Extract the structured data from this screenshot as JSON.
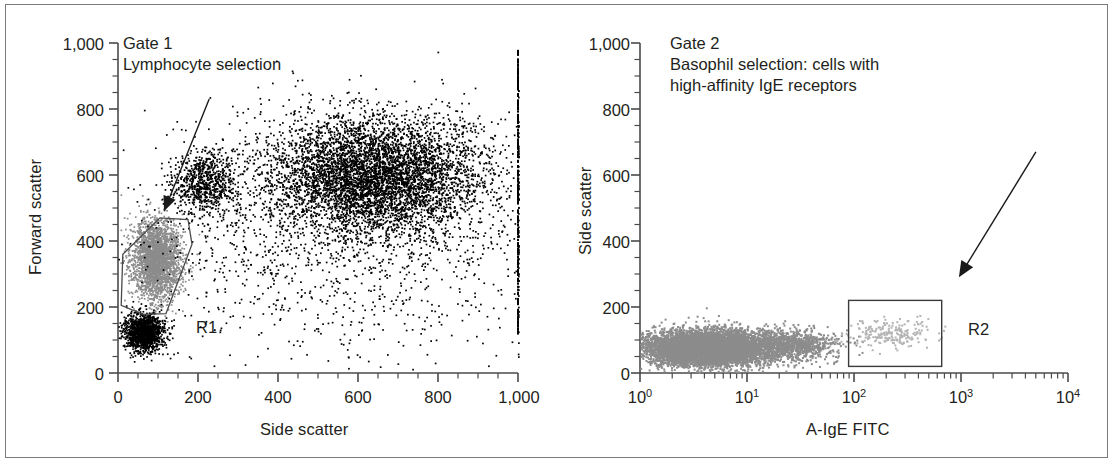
{
  "figure": {
    "type": "flow-cytometry-dot-plots",
    "panel_count": 2,
    "border_color": "#7a7a7a",
    "background": "#ffffff"
  },
  "panels": [
    {
      "id": "gate1",
      "caption_lines": [
        "Gate 1",
        "Lymphocyte selection"
      ],
      "xlabel": "Side scatter",
      "ylabel": "Forward scatter",
      "x_ticks": [
        "0",
        "200",
        "400",
        "600",
        "800",
        "1,000"
      ],
      "y_ticks": [
        "0",
        "200",
        "400",
        "600",
        "800",
        "1,000"
      ],
      "x_minor_interval": 50,
      "y_minor_interval": 50,
      "xlim": [
        0,
        1000
      ],
      "ylim": [
        0,
        1000
      ],
      "xscale": "linear",
      "yscale": "linear",
      "region": {
        "label": "R1",
        "shape": "polygon",
        "fill": "none",
        "stroke": "#4a4a4a"
      },
      "annotation_arrow": {
        "name": "gate1-arrow",
        "description": "arrow pointing into the R1 lymphocyte gate"
      },
      "populations": [
        {
          "name": "lymphocytes-gated",
          "color": "#8c8c8c",
          "note": "grey events inside R1"
        },
        {
          "name": "debris-and-granulocytes",
          "color": "#000000",
          "note": "black events outside R1"
        }
      ]
    },
    {
      "id": "gate2",
      "caption_lines": [
        "Gate 2",
        "Basophil selection: cells with",
        "high-affinity IgE receptors"
      ],
      "xlabel": "A-IgE FITC",
      "ylabel": "Side scatter",
      "x_ticks": [
        "10⁰",
        "10¹",
        "10²",
        "10³",
        "10⁴"
      ],
      "x_tick_bases": [
        "10",
        "10",
        "10",
        "10",
        "10"
      ],
      "x_tick_exponents": [
        "0",
        "1",
        "2",
        "3",
        "4"
      ],
      "y_ticks": [
        "0",
        "200",
        "400",
        "600",
        "800",
        "1,000"
      ],
      "y_minor_interval": 50,
      "xlim": [
        1,
        10000
      ],
      "ylim": [
        0,
        1000
      ],
      "xscale": "log",
      "yscale": "linear",
      "region": {
        "label": "R2",
        "shape": "rectangle",
        "fill": "none",
        "stroke": "#3b3b3b"
      },
      "annotation_arrow": {
        "name": "gate2-arrow",
        "description": "arrow pointing into the R2 basophil gate"
      },
      "populations": [
        {
          "name": "non-basophil-leukocytes",
          "color": "#8c8c8c",
          "note": "grey events low A-IgE FITC"
        },
        {
          "name": "basophils",
          "color": "#8c8c8c",
          "note": "faint grey events inside R2"
        }
      ]
    }
  ],
  "chart_data": [
    {
      "type": "scatter",
      "id": "gate1",
      "title": "Gate 1",
      "subtitle": "Lymphocyte selection",
      "xlabel": "Side scatter",
      "ylabel": "Forward scatter",
      "xlim": [
        0,
        1000
      ],
      "ylim": [
        0,
        1000
      ],
      "xscale": "linear",
      "yscale": "linear",
      "xticks": [
        0,
        200,
        400,
        600,
        800,
        1000
      ],
      "yticks": [
        0,
        200,
        400,
        600,
        800,
        1000
      ],
      "xticklabels": [
        "0",
        "200",
        "400",
        "600",
        "800",
        "1,000"
      ],
      "yticklabels": [
        "0",
        "200",
        "400",
        "600",
        "800",
        "1,000"
      ],
      "grid": false,
      "legend": "none",
      "series": [
        {
          "name": "lymphocytes (R1 gated)",
          "color": "#8c8c8c",
          "n": 2600,
          "cluster": {
            "x_center": 95,
            "y_center": 345,
            "x_sd": 30,
            "y_sd": 62
          }
        },
        {
          "name": "debris / platelets",
          "color": "#000000",
          "n": 1400,
          "cluster": {
            "x_center": 62,
            "y_center": 125,
            "x_sd": 25,
            "y_sd": 28
          }
        },
        {
          "name": "monocytes",
          "color": "#000000",
          "n": 750,
          "cluster": {
            "x_center": 215,
            "y_center": 580,
            "x_sd": 42,
            "y_sd": 48
          }
        },
        {
          "name": "granulocytes",
          "color": "#000000",
          "n": 5200,
          "cluster": {
            "x_center": 640,
            "y_center": 600,
            "x_sd": 135,
            "y_sd": 90
          }
        },
        {
          "name": "scattered events",
          "color": "#000000",
          "n": 1500,
          "cluster": {
            "x_center": 560,
            "y_center": 420,
            "x_sd": 250,
            "y_sd": 190
          }
        }
      ],
      "annotations": [
        {
          "text": "R1",
          "x": 300,
          "y": 150,
          "kind": "region-label"
        },
        {
          "kind": "arrow",
          "from": [
            228,
            830
          ],
          "to": [
            115,
            490
          ]
        }
      ],
      "regions": [
        {
          "label": "R1",
          "type": "polygon",
          "points": [
            [
              8,
              205
            ],
            [
              12,
              360
            ],
            [
              105,
              470
            ],
            [
              175,
              465
            ],
            [
              185,
              390
            ],
            [
              120,
              180
            ],
            [
              62,
              178
            ]
          ]
        }
      ]
    },
    {
      "type": "scatter",
      "id": "gate2",
      "title": "Gate 2",
      "subtitle": "Basophil selection: cells with high-affinity IgE receptors",
      "xlabel": "A-IgE FITC",
      "ylabel": "Side scatter",
      "xlim": [
        1,
        10000
      ],
      "ylim": [
        0,
        1000
      ],
      "xscale": "log",
      "yscale": "linear",
      "xticks": [
        1,
        10,
        100,
        1000,
        10000
      ],
      "yticks": [
        0,
        200,
        400,
        600,
        800,
        1000
      ],
      "xticklabels": [
        "10^0",
        "10^1",
        "10^2",
        "10^3",
        "10^4"
      ],
      "yticklabels": [
        "0",
        "200",
        "400",
        "600",
        "800",
        "1,000"
      ],
      "grid": false,
      "legend": "none",
      "series": [
        {
          "name": "IgE-negative leukocytes",
          "color": "#8c8c8c",
          "n": 7000,
          "cluster": {
            "x_center_log": 0.62,
            "y_center": 78,
            "x_sd_log": 0.3,
            "y_sd": 26
          }
        },
        {
          "name": "intermediate tail",
          "color": "#8c8c8c",
          "n": 900,
          "cluster": {
            "x_center_log": 1.42,
            "y_center": 88,
            "x_sd_log": 0.22,
            "y_sd": 24
          }
        },
        {
          "name": "basophils (R2 gated)",
          "color": "#b4b4b4",
          "n": 220,
          "cluster": {
            "x_center_log": 2.35,
            "y_center": 120,
            "x_sd_log": 0.2,
            "y_sd": 22
          }
        }
      ],
      "annotations": [
        {
          "text": "R2",
          "x_log": 3.12,
          "y": 110,
          "kind": "region-label"
        },
        {
          "kind": "arrow",
          "from_log": [
            3.7,
            670
          ],
          "to_log": [
            2.98,
            290
          ]
        }
      ],
      "regions": [
        {
          "label": "R2",
          "type": "rectangle",
          "x_log_range": [
            1.95,
            2.82
          ],
          "y_range": [
            20,
            220
          ]
        }
      ]
    }
  ]
}
